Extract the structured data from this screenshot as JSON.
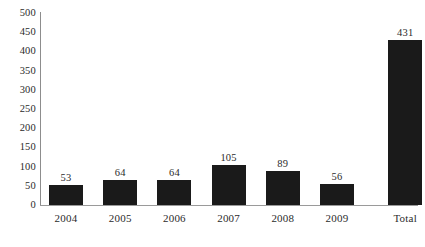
{
  "chart_data": {
    "type": "bar",
    "title": "",
    "subtitle": "",
    "xlabel": "",
    "ylabel": "",
    "categories": [
      "2004",
      "2005",
      "2006",
      "2007",
      "2008",
      "2009",
      "Total"
    ],
    "values": [
      53,
      64,
      64,
      105,
      89,
      56,
      431
    ],
    "data_labels": [
      "53",
      "64",
      "64",
      "105",
      "89",
      "56",
      "431"
    ],
    "ylim": [
      0,
      500
    ],
    "ytick_step": 50,
    "ytick_labels": [
      "500",
      "450",
      "400",
      "350",
      "300",
      "250",
      "200",
      "150",
      "100",
      "50",
      "0"
    ],
    "ytick_values": [
      500,
      450,
      400,
      350,
      300,
      250,
      200,
      150,
      100,
      50,
      0
    ],
    "grid": false,
    "legend": false,
    "legend_position": "none",
    "bar_color": "#1a1a1a",
    "axis_color": "#8d8d8d",
    "background_color": "#ffffff",
    "text_color": "#2b2b2b"
  }
}
